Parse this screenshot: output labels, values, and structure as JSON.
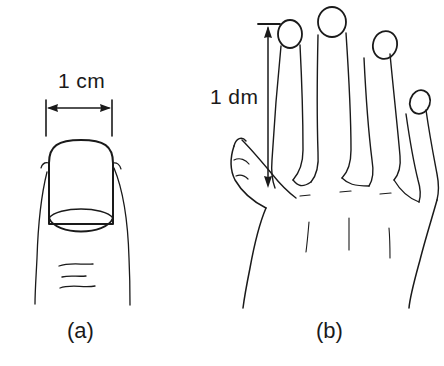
{
  "figure": {
    "kind": "line-art-illustration",
    "background_color": "#ffffff",
    "ink_color": "#1a1a1a",
    "width_px": 444,
    "height_px": 366
  },
  "panel_a": {
    "caption": "(a)",
    "subject": "fingertip-with-fingernail",
    "measurement": {
      "label": "1 cm",
      "orientation": "horizontal",
      "arrow_style": "double-headed",
      "quantity": 1,
      "unit": "cm",
      "describes": "width of fingernail"
    }
  },
  "panel_b": {
    "caption": "(b)",
    "subject": "open-hand-back-view",
    "measurement": {
      "label": "1 dm",
      "orientation": "vertical",
      "arrow_style": "double-headed",
      "quantity": 1,
      "unit": "dm",
      "describes": "length of hand from finger tip to knuckle"
    }
  }
}
